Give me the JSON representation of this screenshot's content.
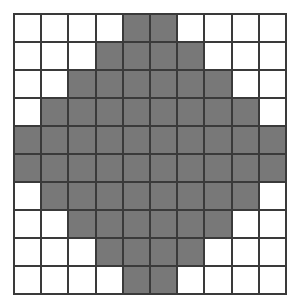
{
  "figure": {
    "width": 299,
    "height": 308
  },
  "grid": {
    "columns": 10,
    "rows": 10,
    "line_color": "#3a3a3a",
    "line_width": 2,
    "empty_color": "#ffffff",
    "filled_color": "#787878",
    "filled_count": 68,
    "empty_count": 32
  },
  "chart_data": {
    "type": "heatmap",
    "xlabel": "",
    "ylabel": "",
    "categories_x": [
      "0",
      "1",
      "2",
      "3",
      "4",
      "5",
      "6",
      "7",
      "8",
      "9"
    ],
    "categories_y": [
      "0",
      "1",
      "2",
      "3",
      "4",
      "5",
      "6",
      "7",
      "8",
      "9"
    ],
    "legend": [
      {
        "label": "filled",
        "value": 1,
        "color": "#787878"
      },
      {
        "label": "empty",
        "value": 0,
        "color": "#ffffff"
      }
    ],
    "values": [
      [
        0,
        0,
        0,
        0,
        1,
        1,
        0,
        0,
        0,
        0
      ],
      [
        0,
        0,
        0,
        1,
        1,
        1,
        1,
        0,
        0,
        0
      ],
      [
        0,
        0,
        1,
        1,
        1,
        1,
        1,
        1,
        0,
        0
      ],
      [
        0,
        1,
        1,
        1,
        1,
        1,
        1,
        1,
        1,
        0
      ],
      [
        1,
        1,
        1,
        1,
        1,
        1,
        1,
        1,
        1,
        1
      ],
      [
        1,
        1,
        1,
        1,
        1,
        1,
        1,
        1,
        1,
        1
      ],
      [
        0,
        1,
        1,
        1,
        1,
        1,
        1,
        1,
        1,
        0
      ],
      [
        0,
        0,
        1,
        1,
        1,
        1,
        1,
        1,
        0,
        0
      ],
      [
        0,
        0,
        0,
        1,
        1,
        1,
        1,
        0,
        0,
        0
      ],
      [
        0,
        0,
        0,
        0,
        1,
        1,
        0,
        0,
        0,
        0
      ]
    ]
  }
}
